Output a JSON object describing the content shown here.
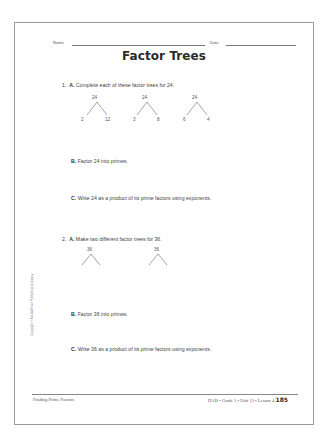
{
  "header": {
    "name_label": "Name",
    "date_label": "Date"
  },
  "title": "Factor Trees",
  "problems": [
    {
      "number": "1.",
      "parts": [
        {
          "letter": "A.",
          "text": "Complete each of these factor trees for 24."
        },
        {
          "letter": "B.",
          "text": "Factor 24 into primes."
        },
        {
          "letter": "C.",
          "text": "Write 24 as a product of its prime factors using exponents."
        }
      ],
      "trees": [
        {
          "root": "24",
          "left": "2",
          "right": "12"
        },
        {
          "root": "24",
          "left": "3",
          "right": "8"
        },
        {
          "root": "24",
          "left": "6",
          "right": "4"
        }
      ]
    },
    {
      "number": "2.",
      "parts": [
        {
          "letter": "A.",
          "text": "Make two different factor trees for 36."
        },
        {
          "letter": "B.",
          "text": "Factor 36 into primes."
        },
        {
          "letter": "C.",
          "text": "Write 36 as a product of its prime factors using exponents."
        }
      ],
      "trees": [
        {
          "root": "36",
          "left": "",
          "right": ""
        },
        {
          "root": "36",
          "left": "",
          "right": ""
        }
      ]
    }
  ],
  "copyright": "Copyright © Kendall/Hunt Publishing Company",
  "footer": {
    "left": "Finding Prime Factors",
    "right": "DAB • Grade 5 • Unit 11 • Lesson 4",
    "page_number": "185"
  }
}
